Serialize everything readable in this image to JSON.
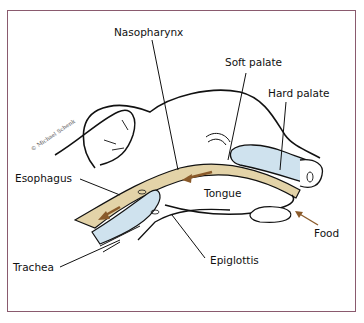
{
  "diagram": {
    "copyright": "© Michael Schenk",
    "labels": {
      "nasopharynx": "Nasopharynx",
      "soft_palate": "Soft palate",
      "hard_palate": "Hard palate",
      "esophagus": "Esophagus",
      "tongue": "Tongue",
      "food": "Food",
      "trachea": "Trachea",
      "epiglottis": "Epiglottis"
    },
    "colors": {
      "frame": "#8a5a6e",
      "food_path": "#e3d3a8",
      "food_arrow": "#8a5a2a",
      "airway": "#cfe2ee",
      "outline": "#111111"
    }
  }
}
